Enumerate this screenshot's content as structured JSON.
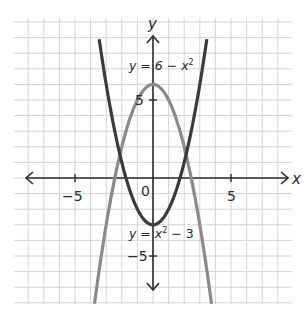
{
  "chart_data": {
    "type": "line",
    "title": "",
    "xlabel": "x",
    "ylabel": "y",
    "xlim": [
      -9,
      9
    ],
    "ylim": [
      -8.2,
      10.2
    ],
    "grid": true,
    "grid_step": 1,
    "x_ticks": [
      {
        "value": -5,
        "label": "−5"
      },
      {
        "value": 5,
        "label": "5"
      }
    ],
    "y_ticks": [
      {
        "value": 5,
        "label": "5"
      },
      {
        "value": -5,
        "label": "−5"
      }
    ],
    "origin_label": "0",
    "series": [
      {
        "name": "y = x² − 3",
        "expression": "x^2 - 3",
        "color": "#3a3a3a",
        "x_range": [
          -3.45,
          3.45
        ]
      },
      {
        "name": "y = 6 − x²",
        "expression": "6 - x^2",
        "color": "#8a8a8a",
        "x_range": [
          -3.75,
          3.75
        ]
      }
    ],
    "annotations": [
      {
        "text_prefix": "y = 6 − x",
        "sup": "2",
        "x": -1.5,
        "y": 7.6
      },
      {
        "text_prefix": "y = x",
        "sup": "2",
        "text_suffix": " − 3",
        "x": -1.5,
        "y": -5.6
      }
    ]
  },
  "labels": {
    "x_axis": "x",
    "y_axis": "y",
    "origin": "0",
    "tick_x_neg5": "−5",
    "tick_x_5": "5",
    "tick_y_5": "5",
    "tick_y_neg5": "−5",
    "curve1_prefix": "y = 6 − x",
    "curve1_sup": "2",
    "curve2_prefix": "y = x",
    "curve2_sup": "2",
    "curve2_suffix": " − 3"
  },
  "colors": {
    "grid": "#d4d4d4",
    "axis": "#2a2a2a",
    "curve_dark": "#3a3a3a",
    "curve_light": "#8a8a8a"
  }
}
